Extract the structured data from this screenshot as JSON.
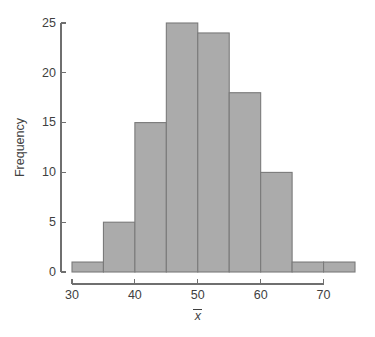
{
  "chart_data": {
    "type": "bar",
    "subtype": "histogram",
    "title": "",
    "subtitle": "",
    "xlabel": "x̄",
    "ylabel": "Frequency",
    "bin_edges": [
      30,
      35,
      40,
      45,
      50,
      55,
      60,
      65,
      70,
      75
    ],
    "categories": [
      "30-35",
      "35-40",
      "40-45",
      "45-50",
      "50-55",
      "55-60",
      "60-65",
      "65-70",
      "70-75"
    ],
    "values": [
      1,
      5,
      15,
      25,
      24,
      18,
      10,
      1,
      1
    ],
    "bin_width": 5,
    "xlim": [
      30,
      75
    ],
    "ylim": [
      0,
      25
    ],
    "xticks": [
      30,
      40,
      50,
      60,
      70
    ],
    "xtick_labels": [
      "30",
      "40",
      "50",
      "60",
      "70"
    ],
    "yticks": [
      0,
      5,
      10,
      15,
      20,
      25
    ],
    "ytick_labels": [
      "0",
      "5",
      "10",
      "15",
      "20",
      "25"
    ],
    "x_axis_line_range": [
      30,
      70
    ],
    "grid": false,
    "legend": null,
    "legend_position": "none",
    "annotations": [],
    "colors": {
      "bar_fill": "#ababab",
      "bar_stroke": "#7a7a7a",
      "axis": "#6f6f6f",
      "text": "#3f3f3f",
      "background": "#ffffff"
    }
  }
}
